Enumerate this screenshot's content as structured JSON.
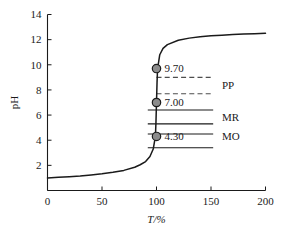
{
  "chart_data": {
    "type": "line",
    "title": "",
    "subtitle": "",
    "xlabel": "T/%",
    "ylabel": "pH",
    "xlim": [
      0,
      200
    ],
    "ylim": [
      0,
      14
    ],
    "grid": false,
    "legend_position": "none",
    "x_ticks": [
      "0",
      "50",
      "100",
      "150",
      "200"
    ],
    "x_tick_values": [
      0,
      50,
      100,
      150,
      200
    ],
    "y_ticks": [
      "2",
      "4",
      "6",
      "8",
      "10",
      "12",
      "14"
    ],
    "y_tick_values": [
      2,
      4,
      6,
      8,
      10,
      12,
      14
    ],
    "series": [
      {
        "name": "titration-curve",
        "x": [
          0,
          10,
          20,
          30,
          40,
          50,
          60,
          70,
          80,
          85,
          90,
          94,
          97,
          99,
          99.5,
          100,
          100.5,
          101,
          103,
          106,
          110,
          120,
          130,
          140,
          150,
          160,
          170,
          180,
          190,
          200
        ],
        "y": [
          1.0,
          1.05,
          1.1,
          1.16,
          1.24,
          1.33,
          1.45,
          1.6,
          1.85,
          2.05,
          2.3,
          2.7,
          3.3,
          4.3,
          5.4,
          7.0,
          8.6,
          9.7,
          10.8,
          11.3,
          11.6,
          11.95,
          12.12,
          12.23,
          12.3,
          12.35,
          12.4,
          12.44,
          12.47,
          12.5
        ]
      }
    ],
    "marked_points": [
      {
        "label": "9.70",
        "x": 100,
        "y": 9.7
      },
      {
        "label": "7.00",
        "x": 100,
        "y": 7.0
      },
      {
        "label": "4.30",
        "x": 100,
        "y": 4.3
      }
    ],
    "indicator_ranges": [
      {
        "name": "PP",
        "label": "PP",
        "style": "dashed",
        "y_low": 7.7,
        "y_high": 9.0,
        "x_start": 100,
        "x_end": 152,
        "label_y": 8.35,
        "label_x": 160
      },
      {
        "name": "MR",
        "label": "MR",
        "style": "solid",
        "y_low": 5.3,
        "y_high": 6.4,
        "x_start": 92,
        "x_end": 152,
        "label_y": 5.85,
        "label_x": 160
      },
      {
        "name": "MO",
        "label": "MO",
        "style": "solid",
        "y_low": 3.4,
        "y_high": 4.5,
        "x_start": 92,
        "x_end": 152,
        "label_y": 4.3,
        "label_x": 160
      }
    ],
    "colors": {
      "axis": "#1a1a1a",
      "curve": "#1a1a1a",
      "marker_fill": "#8c8c8c",
      "marker_stroke": "#1a1a1a",
      "dashed_line": "#4d4d4d",
      "background": "#ffffff"
    }
  }
}
